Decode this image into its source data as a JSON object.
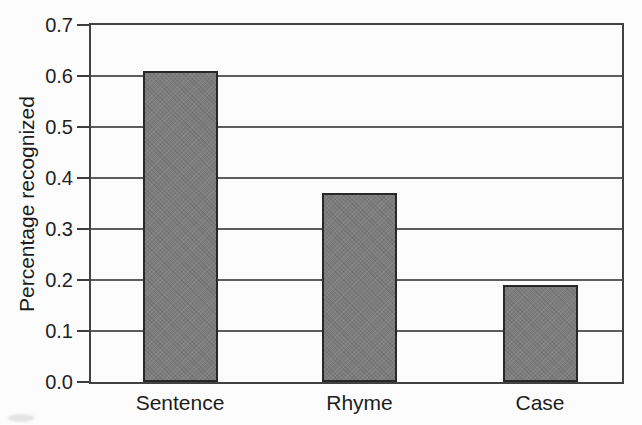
{
  "figure": {
    "background_color": "#fcfcfc",
    "axis_color": "#414141",
    "gridline_color": "#4a4a4a",
    "text_color": "#1c1c1c",
    "bar_fill_color": "#7d7d7d",
    "bar_border_color": "#282828"
  },
  "chart_data": {
    "type": "bar",
    "title": "",
    "xlabel": "",
    "ylabel": "Percentage recognized",
    "categories": [
      "Sentence",
      "Rhyme",
      "Case"
    ],
    "values": [
      0.61,
      0.37,
      0.19
    ],
    "ylim": [
      0,
      0.7
    ],
    "yticks": [
      0.0,
      0.1,
      0.2,
      0.3,
      0.4,
      0.5,
      0.6,
      0.7
    ],
    "ytick_labels": [
      "0.0",
      "0.1",
      "0.2",
      "0.3",
      "0.4",
      "0.5",
      "0.6",
      "0.7"
    ],
    "grid": "horizontal",
    "legend_position": "none",
    "bar_centers_px": [
      180,
      359.5,
      540
    ],
    "bar_width_px": 75,
    "plot_area_px": {
      "left": 89,
      "top": 23,
      "width": 535,
      "height": 361
    }
  }
}
